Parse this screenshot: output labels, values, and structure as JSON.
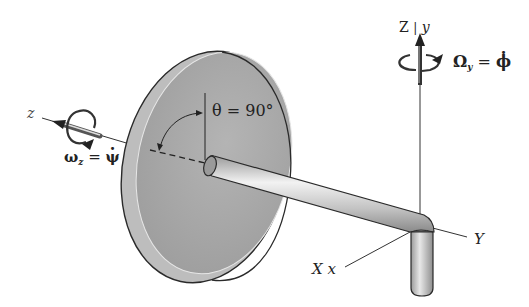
{
  "figure": {
    "labels": {
      "z_axis": "z",
      "spin_label": "ω",
      "spin_sub": "z",
      "spin_eq": " = ",
      "spin_rhs": "ψ",
      "theta": "θ = 90°",
      "Z_axis": "Z",
      "y_axis": "y",
      "axis_sep": "|",
      "precession_label": "Ω",
      "precession_sub": "y",
      "precession_eq": " = ",
      "precession_rhs": "ϕ",
      "Y_axis": "Y",
      "X_axis": "X",
      "x_axis": "x"
    },
    "colors": {
      "disk_face": "#a8a8a8",
      "disk_rim": "#c4c4c4",
      "rod": "#cfcfcf",
      "outline": "#2a2a2a",
      "text": "#222222"
    }
  }
}
